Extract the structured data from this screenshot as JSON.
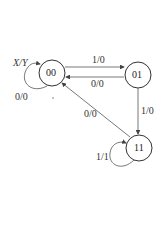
{
  "diagram": {
    "type": "state-machine",
    "legend_label": "X/Y",
    "states": [
      {
        "id": "00",
        "label": "00"
      },
      {
        "id": "01",
        "label": "01"
      },
      {
        "id": "11",
        "label": "11"
      }
    ],
    "transitions": [
      {
        "from": "00",
        "to": "00",
        "label": "0/0"
      },
      {
        "from": "00",
        "to": "01",
        "label": "1/0"
      },
      {
        "from": "01",
        "to": "00",
        "label": "0/0"
      },
      {
        "from": "01",
        "to": "11",
        "label": "1/0"
      },
      {
        "from": "11",
        "to": "00",
        "label": "0/0"
      },
      {
        "from": "11",
        "to": "11",
        "label": "1/1"
      }
    ]
  }
}
